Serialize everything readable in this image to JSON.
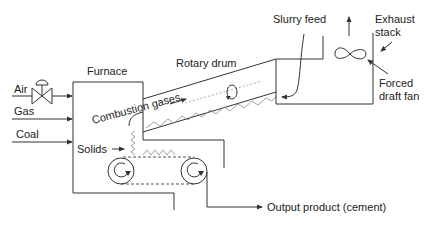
{
  "diagram": {
    "labels": {
      "air": "Air",
      "gas": "Gas",
      "coal": "Coal",
      "furnace": "Furnace",
      "rotary_drum": "Rotary drum",
      "combustion_gases": "Combustion gases",
      "solids": "Solids",
      "slurry_feed": "Slurry feed",
      "exhaust_stack": [
        "Exhaust",
        "stack"
      ],
      "forced_draft_fan": [
        "Forced",
        "draft fan"
      ],
      "output_product": "Output product (cement)"
    },
    "components": [
      {
        "id": "air-valve",
        "type": "control-valve"
      },
      {
        "id": "furnace",
        "type": "box"
      },
      {
        "id": "rotary-drum",
        "type": "inclined-cylinder"
      },
      {
        "id": "feed-box",
        "type": "box"
      },
      {
        "id": "forced-draft-fan",
        "type": "fan-symbol"
      },
      {
        "id": "conveyor",
        "type": "belt-with-two-rollers"
      }
    ],
    "colors": {
      "line": "#333333",
      "text": "#222222",
      "background": "#ffffff"
    }
  }
}
